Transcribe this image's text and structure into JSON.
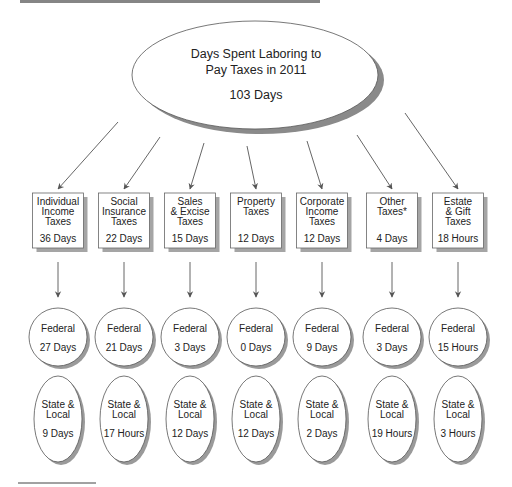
{
  "main": {
    "title_line1": "Days Spent Laboring to",
    "title_line2": "Pay Taxes in 2011",
    "total": "103 Days"
  },
  "categories": [
    {
      "name_lines": [
        "Individual",
        "Income",
        "Taxes"
      ],
      "total": "36 Days",
      "federal": "27 Days",
      "state_local": "9 Days"
    },
    {
      "name_lines": [
        "Social",
        "Insurance",
        "Taxes"
      ],
      "total": "22 Days",
      "federal": "21 Days",
      "state_local": "17 Hours"
    },
    {
      "name_lines": [
        "Sales",
        "& Excise",
        "Taxes"
      ],
      "total": "15 Days",
      "federal": "3 Days",
      "state_local": "12 Days"
    },
    {
      "name_lines": [
        "Property",
        "Taxes"
      ],
      "total": "12 Days",
      "federal": "0 Days",
      "state_local": "12 Days"
    },
    {
      "name_lines": [
        "Corporate",
        "Income",
        "Taxes"
      ],
      "total": "12 Days",
      "federal": "9 Days",
      "state_local": "2 Days"
    },
    {
      "name_lines": [
        "Other",
        "Taxes*"
      ],
      "total": "4 Days",
      "federal": "3 Days",
      "state_local": "19 Hours"
    },
    {
      "name_lines": [
        "Estate",
        "& Gift",
        "Taxes"
      ],
      "total": "18 Hours",
      "federal": "15 Hours",
      "state_local": "3 Hours"
    }
  ],
  "labels": {
    "federal": "Federal",
    "state_local_line1": "State &",
    "state_local_line2": "Local"
  }
}
